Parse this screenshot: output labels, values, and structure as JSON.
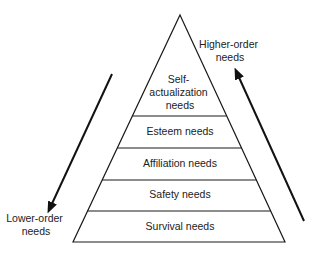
{
  "diagram": {
    "type": "pyramid",
    "colors": {
      "line": "#1a1a1a",
      "text": "#222222",
      "background": "#ffffff"
    },
    "levels": [
      {
        "name": "Self-actualization needs",
        "lines": [
          "Self-",
          "actualization",
          "needs"
        ]
      },
      {
        "name": "Esteem needs",
        "lines": [
          "Esteem needs"
        ]
      },
      {
        "name": "Affiliation needs",
        "lines": [
          "Affiliation needs"
        ]
      },
      {
        "name": "Safety needs",
        "lines": [
          "Safety needs"
        ]
      },
      {
        "name": "Survival needs",
        "lines": [
          "Survival needs"
        ]
      }
    ],
    "left_arrow": {
      "direction": "down",
      "label_lines": [
        "Lower-order",
        "needs"
      ]
    },
    "right_arrow": {
      "direction": "up",
      "label_lines": [
        "Higher-order",
        "needs"
      ]
    }
  }
}
